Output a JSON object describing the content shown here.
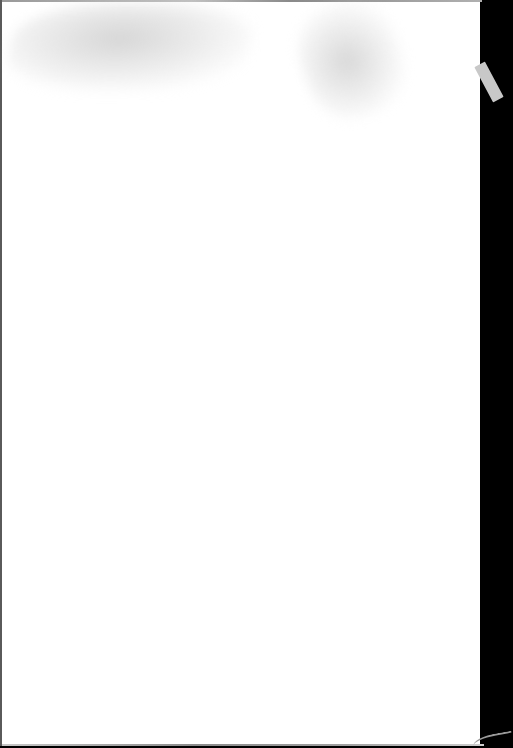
{
  "scene": {
    "description": "Blank sheet of white paper photographed against a black background",
    "paper_color": "#ffffff",
    "background_color": "#000000",
    "visible_text": [],
    "features": [
      {
        "name": "grey-smudge",
        "position": "top-left"
      },
      {
        "name": "grey-smudge",
        "position": "top-center-right"
      },
      {
        "name": "light-grey-tab-strip",
        "position": "right-edge-top"
      },
      {
        "name": "dark-background-strip",
        "position": "right-edge"
      }
    ]
  }
}
